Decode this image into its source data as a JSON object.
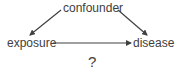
{
  "diagram": {
    "type": "causal-dag",
    "nodes": [
      {
        "id": "confounder",
        "label": "confounder"
      },
      {
        "id": "exposure",
        "label": "exposure"
      },
      {
        "id": "disease",
        "label": "disease"
      }
    ],
    "edges": [
      {
        "from": "confounder",
        "to": "exposure"
      },
      {
        "from": "confounder",
        "to": "disease"
      },
      {
        "from": "exposure",
        "to": "disease"
      }
    ],
    "annotation": "?"
  },
  "colors": {
    "text": "#404040",
    "arrow": "#404040",
    "background": "#ffffff"
  }
}
